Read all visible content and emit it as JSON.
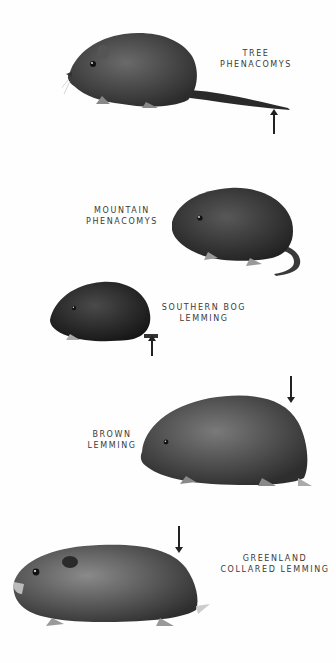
{
  "plate": {
    "species": [
      {
        "id": "tree-phenacomys",
        "label_line1": "TREE",
        "label_line2": "PHENACOMYS",
        "arrow": "up",
        "arrow_marks": "tail tip",
        "fur_color": "#4a4a4a"
      },
      {
        "id": "mountain-phenacomys",
        "label_line1": "MOUNTAIN",
        "label_line2": "PHENACOMYS",
        "fur_color": "#3a3a3a"
      },
      {
        "id": "southern-bog-lemming",
        "label_line1": "SOUTHERN BOG",
        "label_line2": "LEMMING",
        "arrow": "up",
        "arrow_marks": "short tail",
        "fur_color": "#2e2e2e"
      },
      {
        "id": "brown-lemming",
        "label_line1": "BROWN",
        "label_line2": "LEMMING",
        "arrow": "down",
        "arrow_marks": "rump",
        "fur_color": "#555555"
      },
      {
        "id": "greenland-collared-lemming",
        "label_line1": "GREENLAND",
        "label_line2": "COLLARED LEMMING",
        "arrow": "down",
        "arrow_marks": "rump",
        "fur_color": "#5a5a5a"
      }
    ]
  }
}
